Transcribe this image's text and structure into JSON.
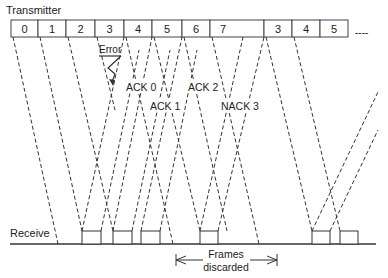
{
  "transmitter": {
    "label": "Transmitter",
    "frames": [
      {
        "label": "0",
        "x0": 11,
        "x1": 38
      },
      {
        "label": "1",
        "x0": 38,
        "x1": 66
      },
      {
        "label": "2",
        "x0": 66,
        "x1": 95
      },
      {
        "label": "3",
        "x0": 95,
        "x1": 124
      },
      {
        "label": "4",
        "x0": 124,
        "x1": 152
      },
      {
        "label": "5",
        "x0": 152,
        "x1": 182
      },
      {
        "label": "6",
        "x0": 182,
        "x1": 210
      },
      {
        "label": "7",
        "x0": 210,
        "x1": 264
      },
      {
        "label": "3",
        "x0": 264,
        "x1": 292
      },
      {
        "label": "4",
        "x0": 292,
        "x1": 320
      },
      {
        "label": "5",
        "x0": 320,
        "x1": 348
      }
    ],
    "continuation": "----"
  },
  "receiver": {
    "label": "Receive",
    "boxes": [
      {
        "x0": 82,
        "x1": 101
      },
      {
        "x0": 113,
        "x1": 132
      },
      {
        "x0": 141,
        "x1": 160
      },
      {
        "x0": 200,
        "x1": 218
      },
      {
        "x0": 312,
        "x1": 330
      },
      {
        "x0": 340,
        "x1": 358
      }
    ]
  },
  "annotations": {
    "error": "Error",
    "ack0": "ACK 0",
    "ack1": "ACK 1",
    "ack2": "ACK 2",
    "nack3": "NACK 3",
    "frames_discarded_line1": "Frames",
    "frames_discarded_line2": "discarded"
  },
  "colors": {
    "line": "#333333",
    "text": "#222222",
    "background": "#ffffff"
  }
}
